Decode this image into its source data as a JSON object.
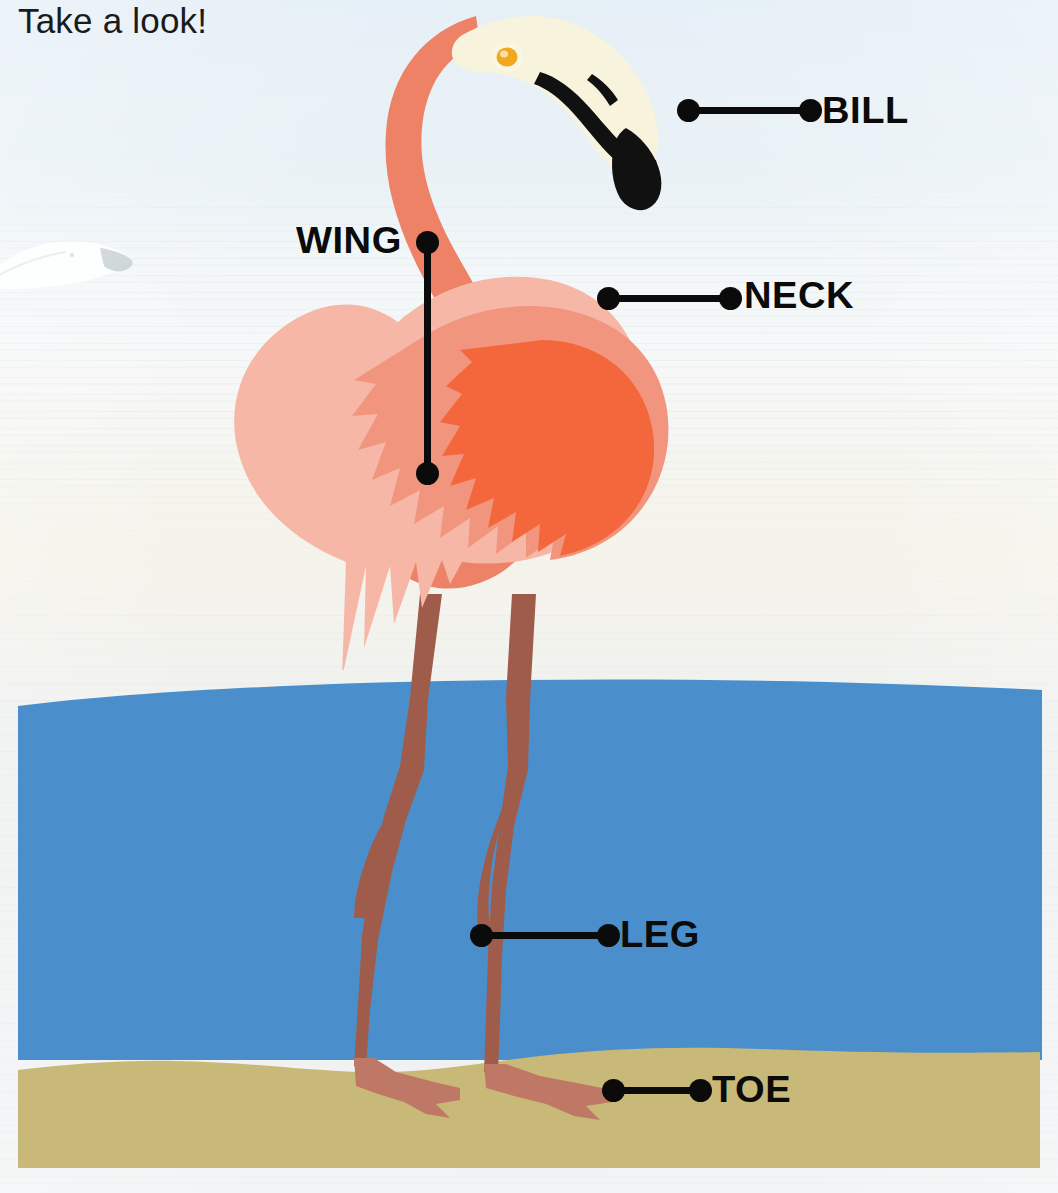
{
  "page": {
    "title": "Take a look!",
    "width": 1058,
    "height": 1193
  },
  "colors": {
    "label_text": "#0b0b0b",
    "leader_line": "#0b0b0b",
    "neck": "#ee8267",
    "head_cream": "#f7f3dd",
    "eye": "#f0a81e",
    "bill_black": "#111111",
    "body_light_pink": "#f6b7a7",
    "wing_salmon": "#f2957f",
    "wing_orange": "#f4673c",
    "leg_brown": "#a05c4a",
    "foot_rose": "#c07866",
    "water_blue": "#4a8fcc",
    "sand_khaki": "#c9b978",
    "background_haze": "#eef3f6"
  },
  "labels": [
    {
      "id": "bill",
      "text": "BILL",
      "anchor_x": 688,
      "anchor_y": 110,
      "end_x": 810,
      "end_y": 110,
      "text_x": 822,
      "text_y": 92
    },
    {
      "id": "wing",
      "text": "WING",
      "anchor_x": 427,
      "anchor_y": 473,
      "end_x": 427,
      "end_y": 242,
      "text_x": 296,
      "text_y": 222
    },
    {
      "id": "neck",
      "text": "NECK",
      "anchor_x": 608,
      "anchor_y": 298,
      "end_x": 730,
      "end_y": 298,
      "text_x": 744,
      "text_y": 278
    },
    {
      "id": "leg",
      "text": "LEG",
      "anchor_x": 481,
      "anchor_y": 935,
      "end_x": 608,
      "end_y": 935,
      "text_x": 620,
      "text_y": 917
    },
    {
      "id": "toe",
      "text": "TOE",
      "anchor_x": 613,
      "anchor_y": 1090,
      "end_x": 700,
      "end_y": 1090,
      "text_x": 712,
      "text_y": 1072
    }
  ],
  "scene": {
    "water": {
      "top": 690,
      "bottom": 1065,
      "left": 18,
      "right": 1042
    },
    "sand": {
      "top": 1060,
      "bottom": 1168,
      "left": 18,
      "right": 1040
    },
    "background_bird": "gull-silhouette"
  }
}
